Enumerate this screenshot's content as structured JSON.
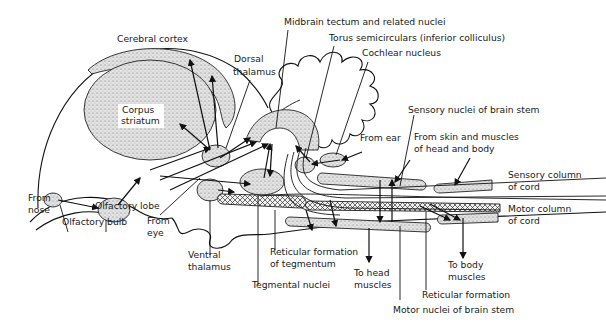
{
  "diagram": {
    "type": "anatomical-schematic",
    "labels": {
      "cerebral_cortex": "Cerebral cortex",
      "corpus_striatum_1": "Corpus",
      "corpus_striatum_2": "striatum",
      "dorsal_thalamus_1": "Dorsal",
      "dorsal_thalamus_2": "thalamus",
      "midbrain_tectum": "Midbrain tectum and related nuclei",
      "torus": "Torus semicirculars (inferior colliculus)",
      "cochlear": "Cochlear nucleus",
      "sensory_nuclei": "Sensory nuclei of brain stem",
      "from_ear": "From ear",
      "from_skin_1": "From skin and muscles",
      "from_skin_2": "of head and body",
      "sensory_column_1": "Sensory column",
      "sensory_column_2": "of cord",
      "motor_column_1": "Motor column",
      "motor_column_2": "of cord",
      "from_nose_1": "From",
      "from_nose_2": "nose",
      "olfactory_bulb": "Olfactory bulb",
      "olfactory_lobe": "Olfactory lobe",
      "from_eye_1": "From",
      "from_eye_2": "eye",
      "ventral_thalamus_1": "Ventral",
      "ventral_thalamus_2": "thalamus",
      "reticular_tegmentum_1": "Reticular formation",
      "reticular_tegmentum_2": "of tegmentum",
      "tegmental_nuclei": "Tegmental nuclei",
      "to_head_1": "To head",
      "to_head_2": "muscles",
      "to_body_1": "To body",
      "to_body_2": "muscles",
      "reticular_formation": "Reticular formation",
      "motor_nuclei": "Motor nuclei of brain stem"
    }
  }
}
